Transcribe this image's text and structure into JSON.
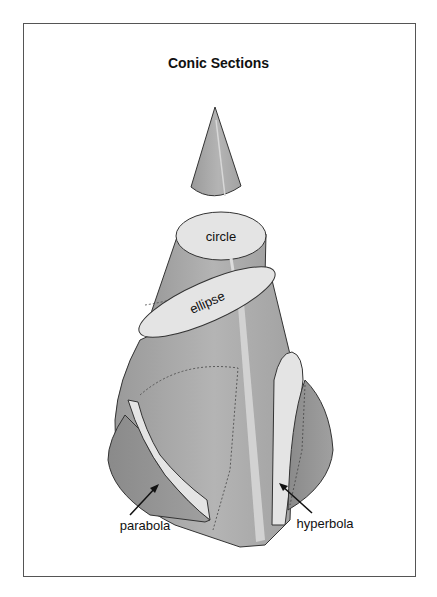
{
  "title": "Conic Sections",
  "labels": {
    "circle": "circle",
    "ellipse": "ellipse",
    "parabola": "parabola",
    "hyperbola": "hyperbola"
  },
  "colors": {
    "cone_fill": "#a8a8a8",
    "cone_dark": "#8e8e8e",
    "section_fill": "#e4e4e4",
    "highlight": "#d8d8d8",
    "stroke": "#333333",
    "frame": "#555555"
  }
}
